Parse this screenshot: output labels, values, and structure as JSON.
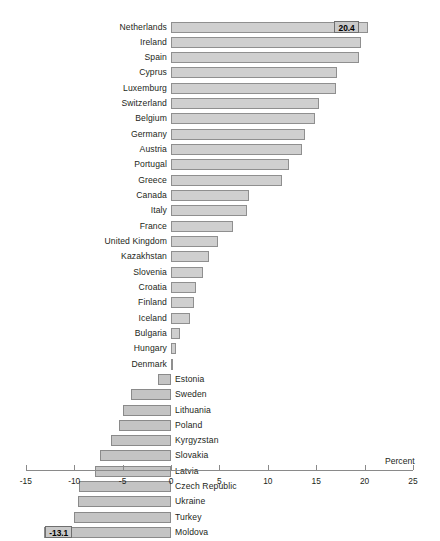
{
  "chart_data": {
    "type": "bar",
    "orientation": "horizontal",
    "title": "",
    "subtitle": "",
    "xlabel": "Percent",
    "ylabel": "",
    "xlim": [
      -15,
      25
    ],
    "xticks": [
      "-15",
      "-10",
      "-5",
      "0",
      "5",
      "10",
      "15",
      "20",
      "25"
    ],
    "xtick_values": [
      -15,
      -10,
      -5,
      0,
      5,
      10,
      15,
      20,
      25
    ],
    "grid": false,
    "legend": null,
    "categories": [
      "Netherlands",
      "Ireland",
      "Spain",
      "Cyprus",
      "Luxemburg",
      "Switzerland",
      "Belgium",
      "Germany",
      "Austria",
      "Portugal",
      "Greece",
      "Canada",
      "Italy",
      "France",
      "United Kingdom",
      "Kazakhstan",
      "Slovenia",
      "Croatia",
      "Finland",
      "Iceland",
      "Bulgaria",
      "Hungary",
      "Denmark",
      "Estonia",
      "Sweden",
      "Lithuania",
      "Poland",
      "Kyrgyzstan",
      "Slovakia",
      "Latvia",
      "Czech Republic",
      "Ukraine",
      "Turkey",
      "Moldova"
    ],
    "values": [
      20.4,
      19.6,
      19.4,
      17.2,
      17.0,
      15.3,
      14.9,
      13.8,
      13.5,
      12.2,
      11.5,
      8.1,
      7.9,
      6.4,
      4.9,
      3.9,
      3.3,
      2.6,
      2.4,
      2.0,
      0.9,
      0.5,
      0.1,
      -1.3,
      -4.1,
      -5.0,
      -5.4,
      -6.2,
      -7.3,
      -7.9,
      -9.5,
      -9.6,
      -10.0,
      -13.1
    ],
    "labeled_points": [
      {
        "category": "Netherlands",
        "label": "20.4"
      },
      {
        "category": "Moldova",
        "label": "-13.1"
      }
    ],
    "colors": {
      "bar_fill": "#cfcfcf",
      "bar_border": "#8f8f8f",
      "text": "#231f20",
      "axis": "#8a8a8a",
      "value_tag_fill": "#c9c9c9"
    }
  }
}
